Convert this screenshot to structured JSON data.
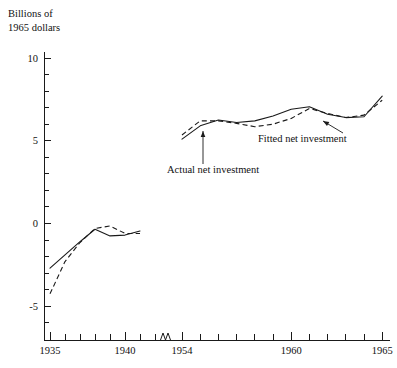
{
  "chart_data": {
    "type": "line",
    "title": "",
    "unit_caption_line1": "Billions of",
    "unit_caption_line2": "1965 dollars",
    "xlabel": "",
    "ylabel": "Billions of 1965 dollars",
    "ylim": [
      -7,
      11
    ],
    "grid": false,
    "legend_position": "inline-annotations",
    "axis_break": {
      "present": true,
      "between_x": [
        1942,
        1953
      ],
      "symbol": "zigzag"
    },
    "y_ticks_major": [
      -5,
      0,
      5,
      10
    ],
    "y_tick_labels": [
      "-5",
      "0",
      "5",
      "10"
    ],
    "y_ticks_minor": [
      -6,
      -4,
      -3,
      -2,
      -1,
      1,
      2,
      3,
      4,
      6,
      7,
      8,
      9
    ],
    "x_ticks_labeled": [
      1935,
      1940,
      1954,
      1960,
      1965
    ],
    "x_tick_labels": [
      "1935",
      "1940",
      "1954",
      "1960",
      "1965"
    ],
    "x_ticks_minor_left": [
      1936,
      1937,
      1938,
      1939,
      1941,
      1942
    ],
    "x_ticks_minor_right": [
      1955,
      1956,
      1957,
      1958,
      1959,
      1961,
      1962,
      1963,
      1964
    ],
    "series": [
      {
        "name": "Actual net investment",
        "style": "solid",
        "segments": [
          {
            "x": [
              1935,
              1936,
              1937,
              1938,
              1939,
              1940,
              1941
            ],
            "values": [
              -2.7,
              -1.9,
              -1.1,
              -0.35,
              -0.75,
              -0.7,
              -0.45
            ]
          },
          {
            "x": [
              1954,
              1955,
              1956,
              1957,
              1958,
              1959,
              1960,
              1961,
              1962,
              1963,
              1964,
              1965
            ],
            "values": [
              5.1,
              5.9,
              6.25,
              6.1,
              6.2,
              6.5,
              6.9,
              7.05,
              6.6,
              6.4,
              6.45,
              7.7
            ]
          }
        ]
      },
      {
        "name": "Fitted net investment",
        "style": "dashed",
        "segments": [
          {
            "x": [
              1935,
              1936,
              1937,
              1938,
              1939,
              1940,
              1941
            ],
            "values": [
              -4.25,
              -2.3,
              -1.15,
              -0.3,
              -0.15,
              -0.6,
              -0.6
            ]
          },
          {
            "x": [
              1954,
              1955,
              1956,
              1957,
              1958,
              1959,
              1960,
              1961,
              1962,
              1963,
              1964,
              1965
            ],
            "values": [
              5.35,
              6.2,
              6.2,
              6.05,
              5.85,
              6.0,
              6.35,
              6.95,
              6.65,
              6.4,
              6.55,
              7.45
            ]
          }
        ]
      }
    ],
    "annotations": [
      {
        "name": "actual-net-investment",
        "text": "Actual net investment",
        "text_x": 167,
        "text_y": 173,
        "leader_from_x": 203,
        "leader_from_y": 164,
        "leader_to_x": 203,
        "leader_to_y": 131,
        "arrow": "up"
      },
      {
        "name": "fitted-net-investment",
        "text": "Fitted net investment",
        "text_x": 258,
        "text_y": 142,
        "leader_from_x": 343,
        "leader_from_y": 133,
        "leader_to_x": 323,
        "leader_to_y": 121,
        "arrow": "up-left"
      }
    ]
  },
  "axis": {
    "y_caption": {
      "line1": "Billions of",
      "line2": "1965 dollars"
    }
  }
}
